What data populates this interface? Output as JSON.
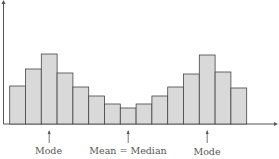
{
  "chart_data": {
    "type": "bar",
    "title": "",
    "xlabel": "",
    "ylabel": "",
    "categories": [
      "1",
      "2",
      "3",
      "4",
      "5",
      "6",
      "7",
      "8",
      "9",
      "10",
      "11",
      "12",
      "13",
      "14",
      "15"
    ],
    "values": [
      38,
      55,
      70,
      51,
      37,
      28,
      20,
      16,
      20,
      28,
      37,
      50,
      69,
      52,
      36
    ],
    "ylim": [
      0,
      124
    ],
    "grid": false,
    "legend": "none",
    "annotations": [
      {
        "label": "Mode",
        "bar_index": 2
      },
      {
        "label": "Mean = Median",
        "bar_index": 7
      },
      {
        "label": "Mode",
        "bar_index": 12
      }
    ],
    "bar_fill": "#d9d9d9",
    "bar_stroke": "#444444"
  },
  "labels": {
    "mode_left": "Mode",
    "center": "Mean = Median",
    "mode_right": "Mode"
  }
}
